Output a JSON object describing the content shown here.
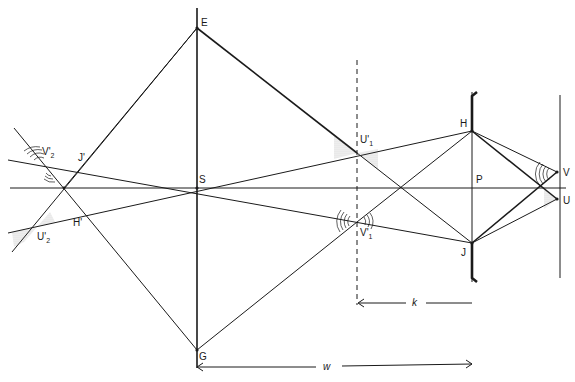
{
  "diagram": {
    "type": "geometric-optics-construction",
    "points": {
      "E": "E",
      "S": "S",
      "G": "G",
      "H": "H",
      "J": "J",
      "P": "P",
      "V": "V",
      "U": "U",
      "U1p": {
        "main": "U'",
        "sub": "1"
      },
      "V1p": {
        "main": "V'",
        "sub": "1"
      },
      "V2p": {
        "main": "V'",
        "sub": "2"
      },
      "U2p": {
        "main": "U'",
        "sub": "2"
      },
      "Jp": "J'",
      "Hp": "H'"
    },
    "dimensions": {
      "k": "k",
      "w": "w"
    }
  }
}
